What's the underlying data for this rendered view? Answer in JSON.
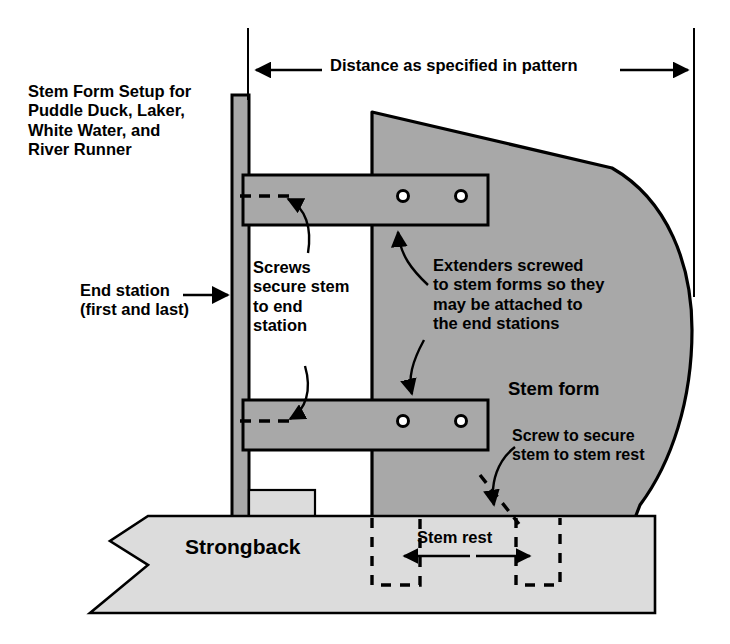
{
  "diagram": {
    "title_lines": "Stem Form Setup for\nPuddle Duck, Laker,\nWhite Water, and\nRiver Runner",
    "dimension_label": "Distance as specified in pattern",
    "labels": {
      "end_station": "End station\n(first and last)",
      "screws_secure": "Screws\nsecure stem\nto end\nstation",
      "extenders": "Extenders screwed\nto stem forms so they\nmay be attached to\nthe end stations",
      "stem_form": "Stem form",
      "screw_to_secure": "Screw to secure\nstem to stem rest",
      "strongback": "Strongback",
      "stem_rest": "Stem rest"
    },
    "colors": {
      "stem_form_fill": "#a8a8a8",
      "extender_fill": "#a8a8a8",
      "end_station_fill": "#a8a8a8",
      "strongback_fill": "#dcdcdc",
      "stroke": "#000000",
      "background": "#ffffff"
    },
    "parts": {
      "end_station": "end-station-post",
      "upper_extender": "upper-extender-bar",
      "lower_extender": "lower-extender-bar",
      "stem_form": "stem-form-shape",
      "strongback": "strongback-beam",
      "stem_rest_block": "stem-rest-block",
      "screw_holes": 4
    }
  }
}
